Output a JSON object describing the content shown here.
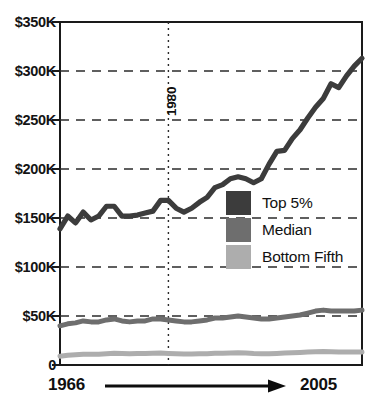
{
  "chart_data": {
    "type": "line",
    "title": "",
    "subtitle": "",
    "xlabel": "",
    "ylabel": "",
    "xlim": [
      1966,
      2005
    ],
    "ylim": [
      0,
      350000
    ],
    "grid": true,
    "gridlines_y": [
      50000,
      100000,
      150000,
      200000,
      250000,
      300000
    ],
    "y_ticks": [
      "0",
      "$50K",
      "$100K",
      "$150K",
      "$200K",
      "$250K",
      "$300K",
      "$350K"
    ],
    "y_tick_values": [
      0,
      50000,
      100000,
      150000,
      200000,
      250000,
      300000,
      350000
    ],
    "x_axis_start_label": "1966",
    "x_axis_end_label": "2005",
    "annotations": [
      {
        "name": "year-marker",
        "label": "1980",
        "x": 1980,
        "orientation": "vertical",
        "style": "dotted"
      }
    ],
    "legend_position": "center-right",
    "x": [
      1966,
      1967,
      1968,
      1969,
      1970,
      1971,
      1972,
      1973,
      1974,
      1975,
      1976,
      1977,
      1978,
      1979,
      1980,
      1981,
      1982,
      1983,
      1984,
      1985,
      1986,
      1987,
      1988,
      1989,
      1990,
      1991,
      1992,
      1993,
      1994,
      1995,
      1996,
      1997,
      1998,
      1999,
      2000,
      2001,
      2002,
      2003,
      2004,
      2005
    ],
    "series": [
      {
        "name": "Top 5%",
        "color": "#3c3c3c",
        "values": [
          139000,
          152000,
          145000,
          156000,
          148000,
          152000,
          162000,
          162000,
          152000,
          152000,
          153000,
          155000,
          157000,
          168000,
          168000,
          160000,
          156000,
          160000,
          166000,
          171000,
          181000,
          184000,
          190000,
          192000,
          190000,
          186000,
          190000,
          205000,
          218000,
          219000,
          231000,
          240000,
          252000,
          263000,
          272000,
          287000,
          283000,
          295000,
          305000,
          313000
        ]
      },
      {
        "name": "Median",
        "color": "#6e6e6e",
        "values": [
          40000,
          42000,
          43000,
          45000,
          44000,
          44000,
          46000,
          47000,
          45000,
          44000,
          45000,
          45000,
          47000,
          47000,
          46000,
          45000,
          44000,
          44000,
          45000,
          46000,
          48000,
          48000,
          49000,
          50000,
          49000,
          48000,
          47000,
          47000,
          48000,
          49000,
          50000,
          51000,
          53000,
          55000,
          56000,
          55000,
          55000,
          55000,
          55000,
          56000
        ]
      },
      {
        "name": "Bottom Fifth",
        "color": "#adadad",
        "values": [
          9000,
          10000,
          10500,
          11000,
          11000,
          11000,
          11500,
          12000,
          11800,
          11500,
          11800,
          11800,
          12000,
          12200,
          11800,
          11500,
          11200,
          11200,
          11400,
          11600,
          11900,
          12000,
          12200,
          12500,
          12200,
          11800,
          11600,
          11500,
          11800,
          12200,
          12500,
          12800,
          13200,
          13600,
          13800,
          13500,
          13300,
          13200,
          13200,
          13300
        ]
      }
    ]
  },
  "axis": {
    "y_labels": [
      {
        "text": "$350K",
        "value": 350000
      },
      {
        "text": "$300K",
        "value": 300000
      },
      {
        "text": "$250K",
        "value": 250000
      },
      {
        "text": "$200K",
        "value": 200000
      },
      {
        "text": "$150K",
        "value": 150000
      },
      {
        "text": "$100K",
        "value": 100000
      },
      {
        "text": "$50K",
        "value": 50000
      },
      {
        "text": "0",
        "value": 0
      }
    ],
    "x_start": "1966",
    "x_end": "2005"
  },
  "marker": {
    "label": "1980"
  },
  "legend": {
    "items": [
      {
        "label": "Top 5%",
        "color": "#3c3c3c"
      },
      {
        "label": "Median",
        "color": "#6e6e6e"
      },
      {
        "label": "Bottom Fifth",
        "color": "#adadad"
      }
    ]
  }
}
